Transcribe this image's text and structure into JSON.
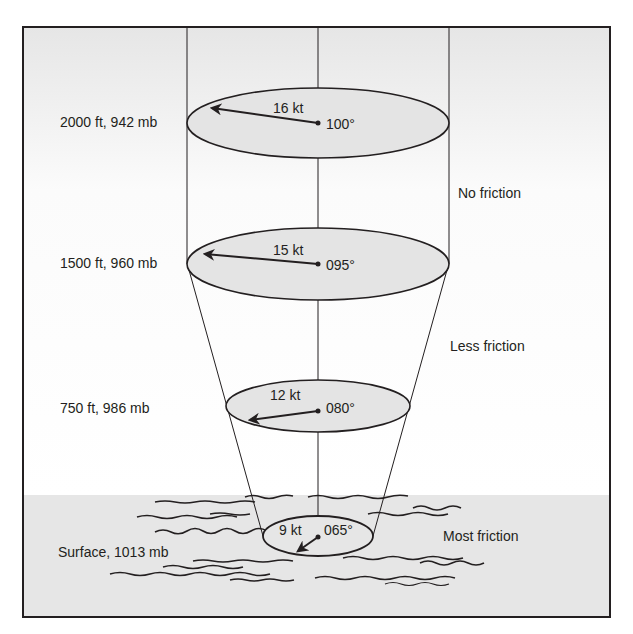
{
  "figure": {
    "type": "wind-profile-friction-diagram",
    "colors": {
      "frame": "#231f20",
      "ellipse_fill": "#e4e4e4",
      "surface_band": "#e6e6e6",
      "sky_top": "#e9e9e9",
      "sky_mid": "#ffffff",
      "ink": "#231f20"
    },
    "levels": [
      {
        "name": "2000 ft",
        "label": "2000 ft,  942 mb",
        "speed": "16 kt",
        "direction": "100°"
      },
      {
        "name": "1500 ft",
        "label": "1500 ft,  960 mb",
        "speed": "15 kt",
        "direction": "095°"
      },
      {
        "name": "750 ft",
        "label": "750 ft,  986 mb",
        "speed": "12 kt",
        "direction": "080°"
      },
      {
        "name": "surface",
        "label": "Surface,  1013 mb",
        "speed": "9 kt",
        "direction": "065°"
      }
    ],
    "zones": [
      {
        "label": "No friction"
      },
      {
        "label": "Less friction"
      },
      {
        "label": "Most friction"
      }
    ]
  }
}
